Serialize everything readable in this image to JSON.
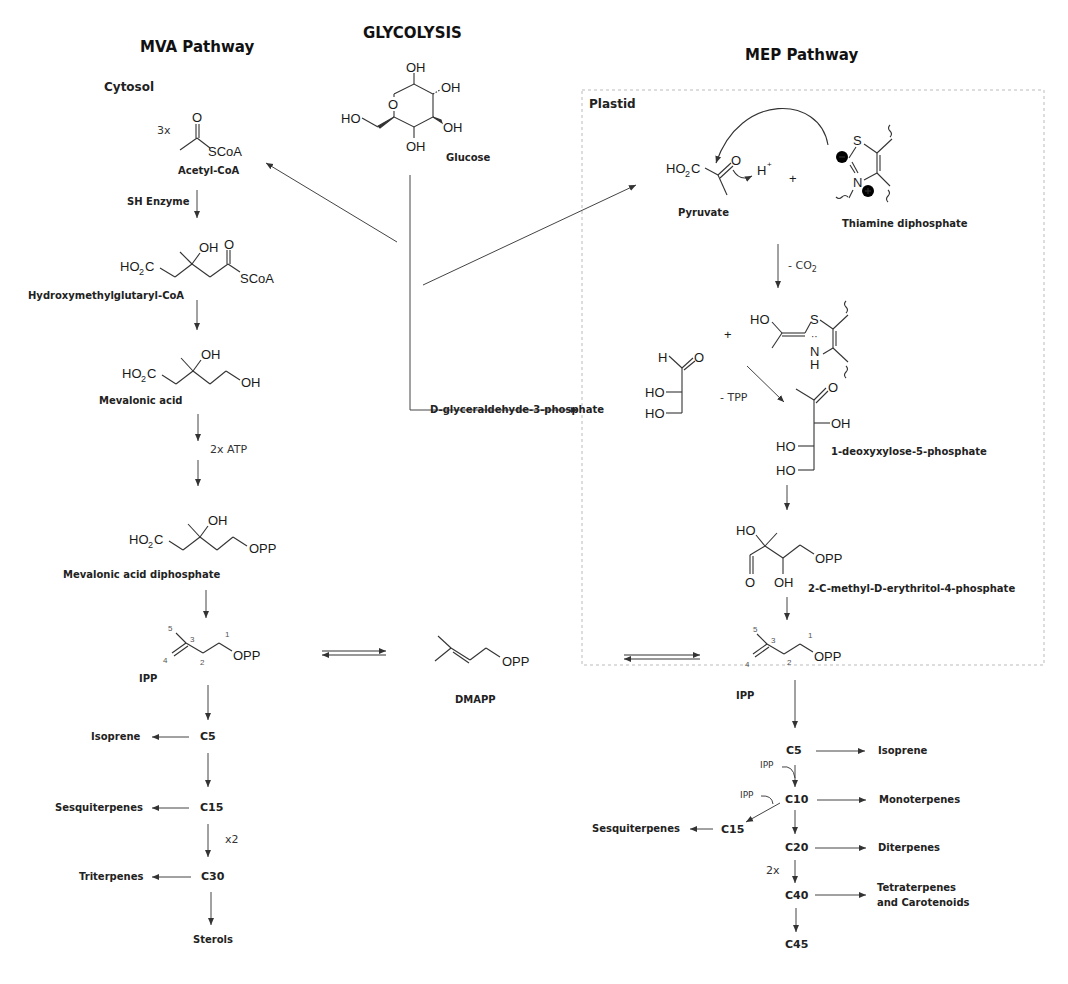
{
  "titles": {
    "mva": "MVA Pathway",
    "glycolysis": "GLYCOLYSIS",
    "mep": "MEP Pathway"
  },
  "regions": {
    "cytosol": "Cytosol",
    "plastid": "Plastid"
  },
  "mva": {
    "acetyl_coa": {
      "multiplier": "3x",
      "group": "SCoA",
      "name": "Acetyl-CoA"
    },
    "step1_note": "SH Enzyme",
    "hmg_coa": {
      "name": "Hydroxymethylglutaryl-CoA"
    },
    "mevalonic_acid": {
      "name": "Mevalonic acid"
    },
    "step3_note": "2x ATP",
    "mva_pp": {
      "name": "Mevalonic acid diphosphate"
    },
    "ipp": {
      "name": "IPP"
    },
    "products": {
      "c5": "C5",
      "isoprene": "Isoprene",
      "c15": "C15",
      "sesquiterpenes": "Sesquiterpenes",
      "x2": "x2",
      "c30": "C30",
      "triterpenes": "Triterpenes",
      "sterols": "Sterols"
    }
  },
  "glycolysis": {
    "glucose": {
      "name": "Glucose"
    },
    "g3p": {
      "name": "D-glyceraldehyde-3-phosphate"
    }
  },
  "mep": {
    "pyruvate": {
      "name": "Pyruvate",
      "h_plus": "H",
      "plus": "+"
    },
    "tpp": {
      "name": "Thiamine diphosphate"
    },
    "decarb_note": "- CO",
    "decarb_sub": "2",
    "tpp_note": "- TPP",
    "dxp": {
      "name": "1-deoxyxylose-5-phosphate"
    },
    "mep": {
      "name": "2-C-methyl-D-erythritol-4-phosphate"
    },
    "ipp": {
      "name": "IPP"
    },
    "products": {
      "c5": "C5",
      "isoprene": "Isoprene",
      "ipp1": "IPP",
      "ipp2": "IPP",
      "c10": "C10",
      "monoterpenes": "Monoterpenes",
      "c15": "C15",
      "sesquiterpenes": "Sesquiterpenes",
      "c20": "C20",
      "diterpenes": "Diterpenes",
      "x2": "2x",
      "c40": "C40",
      "tetraterpenes": "Tetraterpenes",
      "carotenoids": "and Carotenoids",
      "c45": "C45"
    }
  },
  "dmapp": {
    "name": "DMAPP"
  }
}
